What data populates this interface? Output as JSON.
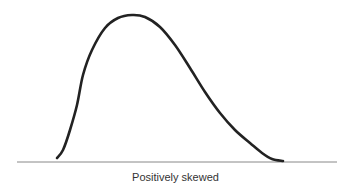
{
  "chart_data": {
    "type": "line",
    "title": "",
    "xlabel": "Positively skewed",
    "ylabel": "",
    "grid": false,
    "legend": null,
    "curve_points_px": [
      [
        57,
        158
      ],
      [
        63,
        150
      ],
      [
        70,
        130
      ],
      [
        77,
        105
      ],
      [
        83,
        75
      ],
      [
        92,
        50
      ],
      [
        105,
        28
      ],
      [
        118,
        18
      ],
      [
        132,
        15
      ],
      [
        145,
        17
      ],
      [
        160,
        27
      ],
      [
        175,
        45
      ],
      [
        190,
        68
      ],
      [
        205,
        92
      ],
      [
        220,
        113
      ],
      [
        235,
        130
      ],
      [
        250,
        143
      ],
      [
        262,
        153
      ],
      [
        272,
        159
      ],
      [
        283,
        161
      ]
    ],
    "baseline_px": {
      "x1": 17,
      "x2": 337,
      "y": 162
    },
    "colors": {
      "curve": "#222222",
      "baseline": "#888888",
      "text": "#333333"
    }
  },
  "caption": "Positively skewed"
}
